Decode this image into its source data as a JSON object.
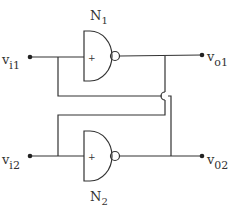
{
  "diagram": {
    "type": "cross-coupled NAND gate circuit",
    "gates": [
      {
        "id": "N1",
        "label": "N",
        "subscript": "1",
        "input_sign": "+"
      },
      {
        "id": "N2",
        "label": "N",
        "subscript": "2",
        "input_sign": "+"
      }
    ],
    "terminals": {
      "vi1": {
        "main": "v",
        "sub": "i1"
      },
      "vi2": {
        "main": "v",
        "sub": "i2"
      },
      "vo1": {
        "main": "v",
        "sub": "o1"
      },
      "vo2": {
        "main": "v",
        "sub": "02"
      }
    },
    "colors": {
      "line": "#333333",
      "background": "#ffffff"
    }
  }
}
